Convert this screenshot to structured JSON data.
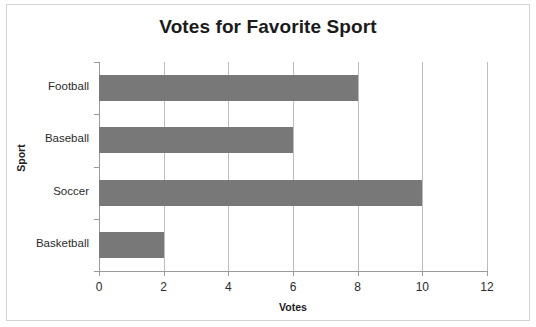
{
  "chart_data": {
    "type": "bar",
    "orientation": "horizontal",
    "title": "Votes for Favorite Sport",
    "xlabel": "Votes",
    "ylabel": "Sport",
    "categories": [
      "Football",
      "Baseball",
      "Soccer",
      "Basketball"
    ],
    "values": [
      8,
      6,
      10,
      2
    ],
    "xlim": [
      0,
      12
    ],
    "xticks": [
      0,
      2,
      4,
      6,
      8,
      10,
      12
    ],
    "xtick_labels": [
      "0",
      "2",
      "4",
      "6",
      "8",
      "10",
      "12"
    ],
    "grid": "vertical",
    "legend": "none",
    "bar_color": "#787878",
    "gridline_color": "#bdbdbd",
    "axis_color": "#9a9a9a",
    "text_color": "#1b1b1b",
    "background_color": "#ffffff",
    "border_color": "#d2d2d2"
  }
}
